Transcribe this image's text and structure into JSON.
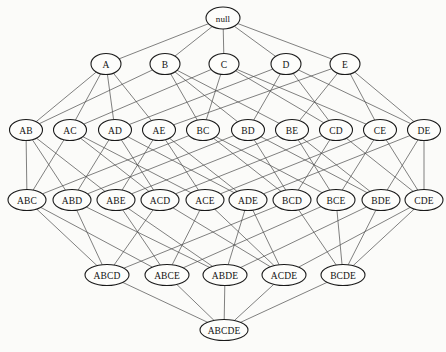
{
  "diagram": {
    "type": "hasse-lattice",
    "ground_set": [
      "A",
      "B",
      "C",
      "D",
      "E"
    ],
    "canvas": {
      "width": 446,
      "height": 352
    },
    "style": {
      "background_color": "#fbfbf9",
      "node_fill": "#fdfdfb",
      "node_stroke": "#1a1a1a",
      "edge_stroke": "#4a4a4a",
      "label_color": "#111111"
    },
    "levels": [
      {
        "rank": 0,
        "y": 18,
        "label": "empty set"
      },
      {
        "rank": 1,
        "y": 64,
        "label": "singletons"
      },
      {
        "rank": 2,
        "y": 130,
        "label": "pairs"
      },
      {
        "rank": 3,
        "y": 200,
        "label": "triples"
      },
      {
        "rank": 4,
        "y": 275,
        "label": "quadruples"
      },
      {
        "rank": 5,
        "y": 330,
        "label": "full set"
      }
    ],
    "nodes": [
      {
        "id": "null",
        "label": "null",
        "members": [],
        "rank": 0,
        "x": 223,
        "y": 18,
        "rx": 17,
        "ry": 11
      },
      {
        "id": "A",
        "label": "A",
        "members": [
          "A"
        ],
        "rank": 1,
        "x": 106,
        "y": 64,
        "rx": 15,
        "ry": 10.5
      },
      {
        "id": "B",
        "label": "B",
        "members": [
          "B"
        ],
        "rank": 1,
        "x": 165,
        "y": 64,
        "rx": 15,
        "ry": 10.5
      },
      {
        "id": "C",
        "label": "C",
        "members": [
          "C"
        ],
        "rank": 1,
        "x": 224,
        "y": 64,
        "rx": 15,
        "ry": 10.5
      },
      {
        "id": "D",
        "label": "D",
        "members": [
          "D"
        ],
        "rank": 1,
        "x": 286,
        "y": 64,
        "rx": 15,
        "ry": 10.5
      },
      {
        "id": "E",
        "label": "E",
        "members": [
          "E"
        ],
        "rank": 1,
        "x": 345,
        "y": 64,
        "rx": 15,
        "ry": 10.5
      },
      {
        "id": "AB",
        "label": "AB",
        "members": [
          "A",
          "B"
        ],
        "rank": 2,
        "x": 26,
        "y": 130,
        "rx": 16.5,
        "ry": 10.5
      },
      {
        "id": "AC",
        "label": "AC",
        "members": [
          "A",
          "C"
        ],
        "rank": 2,
        "x": 70,
        "y": 130,
        "rx": 16.5,
        "ry": 10.5
      },
      {
        "id": "AD",
        "label": "AD",
        "members": [
          "A",
          "D"
        ],
        "rank": 2,
        "x": 115,
        "y": 130,
        "rx": 16.5,
        "ry": 10.5
      },
      {
        "id": "AE",
        "label": "AE",
        "members": [
          "A",
          "E"
        ],
        "rank": 2,
        "x": 159,
        "y": 130,
        "rx": 16.5,
        "ry": 10.5
      },
      {
        "id": "BC",
        "label": "BC",
        "members": [
          "B",
          "C"
        ],
        "rank": 2,
        "x": 203,
        "y": 130,
        "rx": 16.5,
        "ry": 10.5
      },
      {
        "id": "BD",
        "label": "BD",
        "members": [
          "B",
          "D"
        ],
        "rank": 2,
        "x": 248,
        "y": 130,
        "rx": 16.5,
        "ry": 10.5
      },
      {
        "id": "BE",
        "label": "BE",
        "members": [
          "B",
          "E"
        ],
        "rank": 2,
        "x": 292,
        "y": 130,
        "rx": 16.5,
        "ry": 10.5
      },
      {
        "id": "CD",
        "label": "CD",
        "members": [
          "C",
          "D"
        ],
        "rank": 2,
        "x": 336,
        "y": 130,
        "rx": 16.5,
        "ry": 10.5
      },
      {
        "id": "CE",
        "label": "CE",
        "members": [
          "C",
          "E"
        ],
        "rank": 2,
        "x": 380,
        "y": 130,
        "rx": 16.5,
        "ry": 10.5
      },
      {
        "id": "DE",
        "label": "DE",
        "members": [
          "D",
          "E"
        ],
        "rank": 2,
        "x": 424,
        "y": 130,
        "rx": 16.5,
        "ry": 10.5
      },
      {
        "id": "ABC",
        "label": "ABC",
        "members": [
          "A",
          "B",
          "C"
        ],
        "rank": 3,
        "x": 27,
        "y": 200,
        "rx": 19,
        "ry": 10.5
      },
      {
        "id": "ABD",
        "label": "ABD",
        "members": [
          "A",
          "B",
          "D"
        ],
        "rank": 3,
        "x": 72,
        "y": 200,
        "rx": 19,
        "ry": 10.5
      },
      {
        "id": "ABE",
        "label": "ABE",
        "members": [
          "A",
          "B",
          "E"
        ],
        "rank": 3,
        "x": 116,
        "y": 200,
        "rx": 19,
        "ry": 10.5
      },
      {
        "id": "ACD",
        "label": "ACD",
        "members": [
          "A",
          "C",
          "D"
        ],
        "rank": 3,
        "x": 160,
        "y": 200,
        "rx": 19,
        "ry": 10.5
      },
      {
        "id": "ACE",
        "label": "ACE",
        "members": [
          "A",
          "C",
          "E"
        ],
        "rank": 3,
        "x": 205,
        "y": 200,
        "rx": 19,
        "ry": 10.5
      },
      {
        "id": "ADE",
        "label": "ADE",
        "members": [
          "A",
          "D",
          "E"
        ],
        "rank": 3,
        "x": 248,
        "y": 200,
        "rx": 19,
        "ry": 10.5
      },
      {
        "id": "BCD",
        "label": "BCD",
        "members": [
          "B",
          "C",
          "D"
        ],
        "rank": 3,
        "x": 292,
        "y": 200,
        "rx": 19,
        "ry": 10.5
      },
      {
        "id": "BCE",
        "label": "BCE",
        "members": [
          "B",
          "C",
          "E"
        ],
        "rank": 3,
        "x": 336,
        "y": 200,
        "rx": 19,
        "ry": 10.5
      },
      {
        "id": "BDE",
        "label": "BDE",
        "members": [
          "B",
          "D",
          "E"
        ],
        "rank": 3,
        "x": 381,
        "y": 200,
        "rx": 19,
        "ry": 10.5
      },
      {
        "id": "CDE",
        "label": "CDE",
        "members": [
          "C",
          "D",
          "E"
        ],
        "rank": 3,
        "x": 424,
        "y": 200,
        "rx": 19,
        "ry": 10.5
      },
      {
        "id": "ABCD",
        "label": "ABCD",
        "members": [
          "A",
          "B",
          "C",
          "D"
        ],
        "rank": 4,
        "x": 107,
        "y": 275,
        "rx": 22,
        "ry": 10.5
      },
      {
        "id": "ABCE",
        "label": "ABCE",
        "members": [
          "A",
          "B",
          "C",
          "E"
        ],
        "rank": 4,
        "x": 167,
        "y": 275,
        "rx": 22,
        "ry": 10.5
      },
      {
        "id": "ABDE",
        "label": "ABDE",
        "members": [
          "A",
          "B",
          "D",
          "E"
        ],
        "rank": 4,
        "x": 225,
        "y": 275,
        "rx": 22,
        "ry": 10.5
      },
      {
        "id": "ACDE",
        "label": "ACDE",
        "members": [
          "A",
          "C",
          "D",
          "E"
        ],
        "rank": 4,
        "x": 284,
        "y": 275,
        "rx": 22,
        "ry": 10.5
      },
      {
        "id": "BCDE",
        "label": "BCDE",
        "members": [
          "B",
          "C",
          "D",
          "E"
        ],
        "rank": 4,
        "x": 343,
        "y": 275,
        "rx": 22,
        "ry": 10.5
      },
      {
        "id": "ABCDE",
        "label": "ABCDE",
        "members": [
          "A",
          "B",
          "C",
          "D",
          "E"
        ],
        "rank": 5,
        "x": 224,
        "y": 330,
        "rx": 24,
        "ry": 10.5
      }
    ]
  }
}
